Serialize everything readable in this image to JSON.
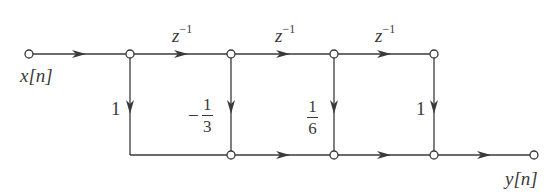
{
  "diagram": {
    "type": "signal-flow-graph",
    "input_label": "x[n]",
    "output_label": "y[n]",
    "delay_labels": [
      "z",
      "z",
      "z"
    ],
    "delay_exponent": "−1",
    "branch_gains": [
      {
        "label": "1"
      },
      {
        "sign": "−",
        "num": "1",
        "den": "3"
      },
      {
        "num": "1",
        "den": "6"
      },
      {
        "label": "1"
      }
    ],
    "colors": {
      "line": "#3a3a3a",
      "node_fill": "#ffffff"
    },
    "nodes": {
      "input": [
        29,
        54
      ],
      "top": [
        [
          130,
          54
        ],
        [
          231,
          54
        ],
        [
          334,
          54
        ],
        [
          434,
          54
        ]
      ],
      "bottom": [
        [
          231,
          155
        ],
        [
          334,
          155
        ],
        [
          434,
          155
        ]
      ],
      "output": [
        534,
        155
      ]
    }
  }
}
